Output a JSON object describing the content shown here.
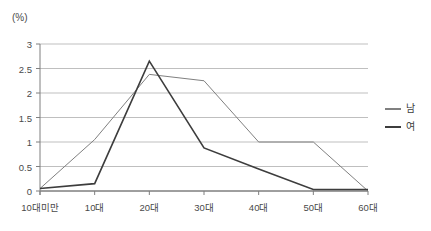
{
  "chart_data": {
    "type": "line",
    "title": "",
    "unit_label": "(%)",
    "xlabel": "",
    "ylabel": "",
    "categories": [
      "10대미만",
      "10대",
      "20대",
      "30대",
      "40대",
      "50대",
      "60대"
    ],
    "ylim": [
      0,
      3
    ],
    "ytick_values": [
      0,
      0.5,
      1,
      1.5,
      2,
      2.5,
      3
    ],
    "ytick_labels": [
      "0",
      "0.5",
      "1",
      "1.5",
      "2",
      "2.5",
      "3"
    ],
    "grid": true,
    "legend_position": "right",
    "series": [
      {
        "name": "남",
        "color": "#808080",
        "width": 1,
        "values": [
          0.05,
          1.05,
          2.38,
          2.25,
          1.0,
          1.0,
          0.0
        ]
      },
      {
        "name": "여",
        "color": "#3d3d3d",
        "width": 1.6,
        "values": [
          0.05,
          0.15,
          2.65,
          0.88,
          0.45,
          0.03,
          0.03
        ]
      }
    ]
  },
  "axis": {
    "line_color": "#7f7f7f",
    "grid_color": "#bfbfbf"
  }
}
